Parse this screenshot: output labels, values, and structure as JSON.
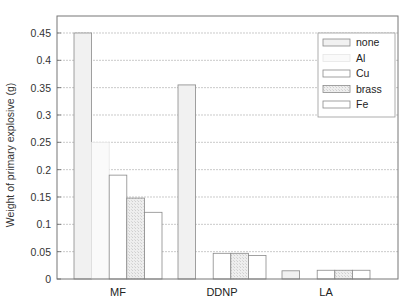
{
  "chart_data": {
    "type": "bar",
    "title": "",
    "xlabel": "",
    "ylabel": "Weight of primary explosive (g)",
    "ylim": [
      0,
      0.48
    ],
    "yticks": [
      0,
      0.05,
      0.1,
      0.15,
      0.2,
      0.25,
      0.3,
      0.35,
      0.4,
      0.45
    ],
    "ytick_labels": [
      "0",
      "0.05",
      "0.1",
      "0.15",
      "0.2",
      "0.25",
      "0.3",
      "0.35",
      "0.4",
      "0.45"
    ],
    "grid": true,
    "legend_position": "upper right",
    "categories": [
      "MF",
      "DDNP",
      "LA"
    ],
    "series": [
      {
        "name": "none",
        "values": [
          0.45,
          0.355,
          0.015
        ],
        "fill": "#f1f1f1",
        "stroke": "#8a8a8a"
      },
      {
        "name": "Al",
        "values": [
          0.25,
          0.0,
          0.0
        ],
        "fill": "#fafafa",
        "stroke": "#e6e6e6"
      },
      {
        "name": "Cu",
        "values": [
          0.19,
          0.047,
          0.016
        ],
        "fill": "#ffffff",
        "stroke": "#8a8a8a"
      },
      {
        "name": "brass",
        "values": [
          0.148,
          0.047,
          0.016
        ],
        "fill": "#e8e8e8",
        "stroke": "#8a8a8a"
      },
      {
        "name": "Fe",
        "values": [
          0.122,
          0.043,
          0.016
        ],
        "fill": "#ffffff",
        "stroke": "#8a8a8a"
      }
    ]
  }
}
